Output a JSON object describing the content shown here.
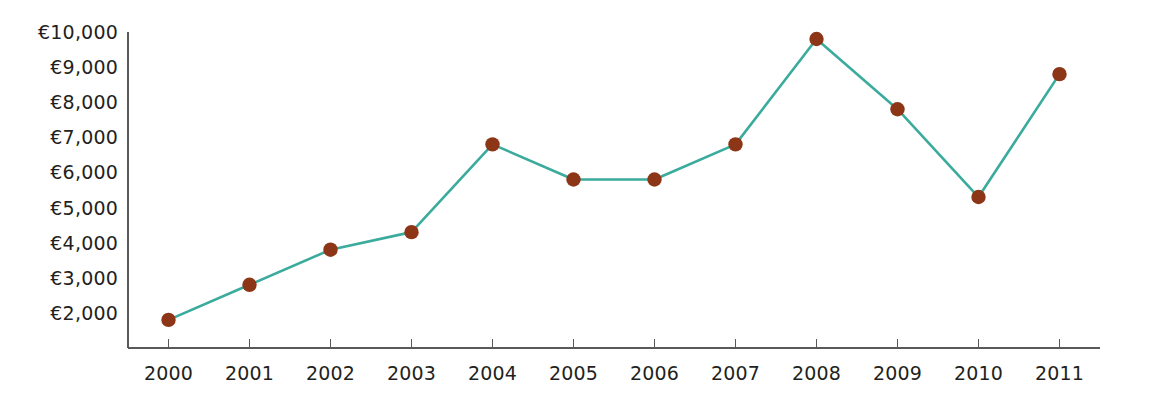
{
  "chart_data": {
    "type": "line",
    "title": "",
    "subtitle": "",
    "xlabel": "",
    "ylabel": "",
    "categories": [
      "2000",
      "2001",
      "2002",
      "2003",
      "2004",
      "2005",
      "2006",
      "2007",
      "2008",
      "2009",
      "2010",
      "2011"
    ],
    "values": [
      1800,
      2800,
      3800,
      4300,
      6800,
      5800,
      5800,
      6800,
      9800,
      7800,
      5300,
      8800
    ],
    "series": [
      {
        "name": "",
        "values": [
          1800,
          2800,
          3800,
          4300,
          6800,
          5800,
          5800,
          6800,
          9800,
          7800,
          5300,
          8800
        ]
      }
    ],
    "ylim": [
      1000,
      10000
    ],
    "ytick_values": [
      2000,
      3000,
      4000,
      5000,
      6000,
      7000,
      8000,
      9000,
      10000
    ],
    "ytick_labels": [
      "€2,000",
      "€3,000",
      "€4,000",
      "€5,000",
      "€6,000",
      "€7,000",
      "€8,000",
      "€9,000",
      "€10,000"
    ],
    "xtick_labels": [
      "2000",
      "2001",
      "2002",
      "2003",
      "2004",
      "2005",
      "2006",
      "2007",
      "2008",
      "2009",
      "2010",
      "2011"
    ],
    "currency_symbol": "€",
    "grid": false,
    "legend": false,
    "legend_position": "none",
    "annotations": []
  },
  "style": {
    "line_color": "#3aab9c",
    "marker_color": "#8c3517",
    "axis_color": "#58595b",
    "text_color": "#231f20",
    "background_color": "#ffffff",
    "line_width": 2.6,
    "marker_radius": 7.2
  },
  "geometry": {
    "plot_left": 128,
    "plot_right": 1100,
    "plot_top": 32,
    "plot_bottom": 348,
    "y_value_top": 10000,
    "y_value_bottom": 1000,
    "tick_length": 9,
    "x_label_baseline": 380,
    "y_label_offset_x": 118,
    "y_label_baseline_nudge": 7
  }
}
